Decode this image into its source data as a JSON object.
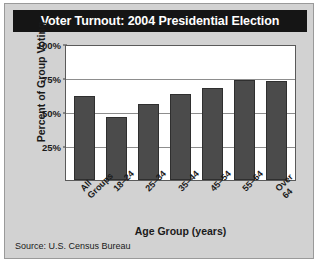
{
  "card": {
    "title": "Voter Turnout: 2004 Presidential Election",
    "source": "Source: U.S. Census Bureau",
    "colors": {
      "banner_background": "#151515",
      "banner_text": "#ffffff",
      "card_background": "#d2d2d2",
      "plot_background": "#ffffff",
      "bar_fill": "#4b4b4b",
      "gridline": "#8d8d8d"
    }
  },
  "chart_data": {
    "type": "bar",
    "title": "Voter Turnout: 2004 Presidential Election",
    "xlabel": "Age Group (years)",
    "ylabel": "Percent of Group Voting",
    "categories": [
      "All Groups",
      "18–24",
      "25–34",
      "35–44",
      "45–54",
      "55–64",
      "Over 64"
    ],
    "values": [
      63,
      47,
      57,
      64,
      69,
      75,
      74
    ],
    "ylim": [
      0,
      100
    ],
    "yticks": [
      25,
      50,
      75,
      100
    ],
    "ytick_labels": [
      "25%",
      "50%",
      "75%",
      "100%"
    ],
    "grid": "horizontal",
    "legend": "none",
    "source": "Source: U.S. Census Bureau"
  }
}
